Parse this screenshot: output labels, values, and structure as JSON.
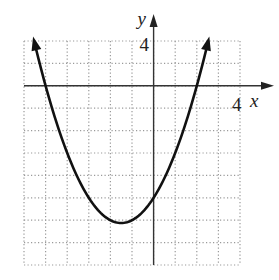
{
  "chart_data": {
    "type": "line",
    "title": "",
    "function": "y = x^2 + 3x - 10",
    "xlabel": "x",
    "ylabel": "y",
    "x_tick_label": "4",
    "y_tick_label": "4",
    "xlim": [
      -6,
      4
    ],
    "ylim": [
      -16,
      4
    ],
    "x_grid_step": 1,
    "y_grid_step": 2,
    "grid": "dotted",
    "series": [
      {
        "name": "parabola",
        "x": [
          -5.53,
          -5,
          -4,
          -3,
          -2,
          -1.5,
          -1,
          0,
          1,
          2,
          2.53
        ],
        "y": [
          4,
          0,
          -6,
          -10,
          -12,
          -12.25,
          -12,
          -10,
          -6,
          0,
          4
        ]
      }
    ],
    "annotations": {
      "vertex": [
        -1.5,
        -12.25
      ],
      "x_intercepts": [
        -5,
        2
      ],
      "y_intercept": -10,
      "arrows_at_ends": true
    }
  },
  "labels": {
    "x_axis": "x",
    "y_axis": "y",
    "x_tick": "4",
    "y_tick": "4"
  }
}
